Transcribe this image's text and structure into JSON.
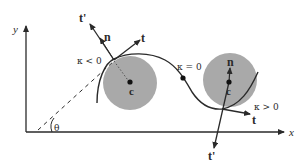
{
  "figure": {
    "axes": {
      "x_label": "x",
      "y_label": "y",
      "angle_label": "θ"
    },
    "curve": {
      "description": "sinusoidal curve with an inflection point"
    },
    "left_osculating_circle": {
      "center_label": "c",
      "curvature_label": "κ < 0",
      "tangent_label": "t",
      "normal_label": "n",
      "rotated_tangent_label": "t'"
    },
    "inflection_point": {
      "curvature_label": "κ = 0"
    },
    "right_osculating_circle": {
      "center_label": "c",
      "curvature_label": "κ > 0",
      "tangent_label": "t",
      "normal_label": "n",
      "rotated_tangent_label": "t'"
    },
    "colors": {
      "line": "#2a2a2a",
      "circle_fill": "#a9a9a9",
      "background": "#ffffff"
    }
  }
}
